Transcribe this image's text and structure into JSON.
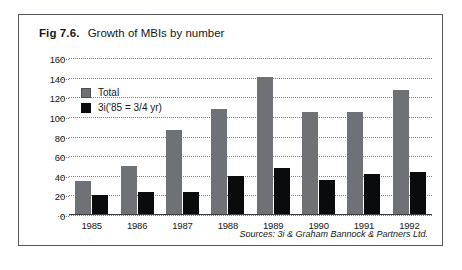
{
  "figure": {
    "number": "Fig 7.6.",
    "caption": "Growth of MBIs by number",
    "source_note": "Sources: 3i & Graham Bannock & Partners Ltd.",
    "frame_color": "#55585c"
  },
  "legend": {
    "position": "inside-top-left",
    "entries": [
      {
        "label": "Total",
        "color": "#6e7175"
      },
      {
        "label": "3i('85 = 3/4 yr)",
        "color": "#0a0b0c"
      }
    ]
  },
  "chart_data": {
    "type": "bar",
    "title": "Growth of MBIs by number",
    "xlabel": "",
    "ylabel": "",
    "ylim": [
      0,
      160
    ],
    "yticks": [
      0,
      20,
      40,
      60,
      80,
      100,
      120,
      140,
      160
    ],
    "ytick_labels": [
      "0",
      "20",
      "40",
      "60",
      "80",
      "100",
      "120",
      "140",
      "160"
    ],
    "grid": true,
    "grid_style": "dotted-horizontal",
    "legend_position": "inside-top-left",
    "categories": [
      "1985",
      "1986",
      "1987",
      "1988",
      "1989",
      "1990",
      "1991",
      "1992"
    ],
    "series": [
      {
        "name": "Total",
        "color": "#6e7175",
        "values": [
          35,
          50,
          87,
          108,
          141,
          105,
          105,
          127
        ]
      },
      {
        "name": "3i('85 = 3/4 yr)",
        "color": "#0a0b0c",
        "values": [
          20,
          23,
          23,
          40,
          48,
          36,
          42,
          44
        ]
      }
    ]
  }
}
